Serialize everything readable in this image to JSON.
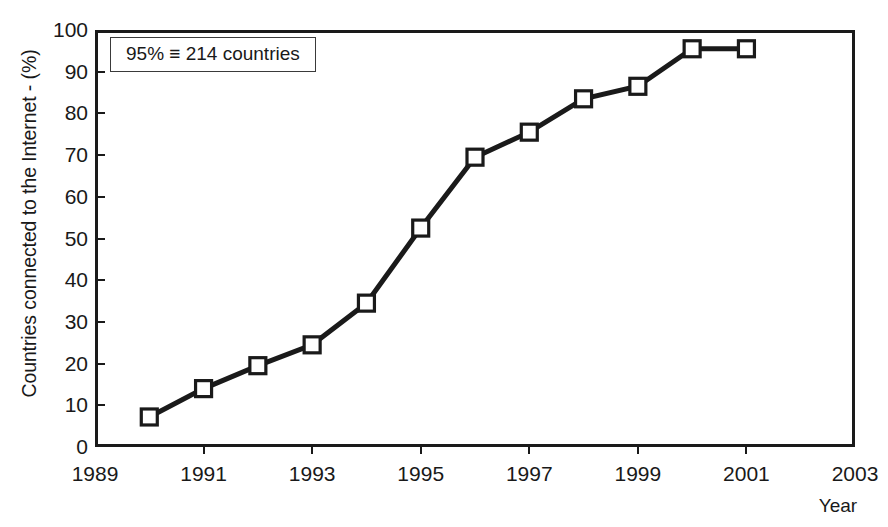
{
  "chart_data": {
    "type": "line",
    "title": "",
    "xlabel": "Year",
    "ylabel": "Countries connected to the Internet - (%)",
    "x": [
      1990,
      1991,
      1992,
      1993,
      1994,
      1995,
      1996,
      1997,
      1998,
      1999,
      2000,
      2001
    ],
    "values": [
      7.2,
      14.0,
      19.5,
      24.5,
      34.5,
      52.5,
      69.5,
      75.5,
      83.5,
      86.5,
      95.5,
      95.5
    ],
    "series": [
      {
        "name": "Countries connected to the Internet",
        "values": [
          7.2,
          14.0,
          19.5,
          24.5,
          34.5,
          52.5,
          69.5,
          75.5,
          83.5,
          86.5,
          95.5,
          95.5
        ]
      }
    ],
    "xlim": [
      1989,
      2003
    ],
    "ylim": [
      0,
      100
    ],
    "xticks": [
      "1989",
      "1991",
      "1993",
      "1995",
      "1997",
      "1999",
      "2001",
      "2003"
    ],
    "xtick_values": [
      1989,
      1991,
      1993,
      1995,
      1997,
      1999,
      2001,
      2003
    ],
    "yticks": [
      "0",
      "10",
      "20",
      "30",
      "40",
      "50",
      "60",
      "70",
      "80",
      "90",
      "100"
    ],
    "ytick_values": [
      0,
      10,
      20,
      30,
      40,
      50,
      60,
      70,
      80,
      90,
      100
    ],
    "grid": false,
    "legend": null,
    "marker": "open-square",
    "line_color": "#1a1a1a",
    "marker_fill": "#ffffff",
    "background": "#ffffff",
    "annotations": [
      {
        "text": "95% ≡ 214 countries",
        "x": 1989.4,
        "y": 96,
        "boxed": true
      }
    ]
  },
  "figure": {
    "caption_remnant": "",
    "annotation_text": "95% ≡ 214 countries",
    "xlabel_text": "Year",
    "ylabel_text": "Countries connected to the Internet - (%)"
  }
}
